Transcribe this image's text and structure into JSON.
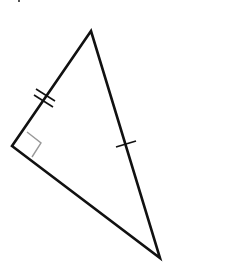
{
  "diagram": {
    "type": "geometry-triangle",
    "colors": {
      "background": "#ffffff",
      "stroke": "#111111",
      "right_angle_marker": "#999999"
    },
    "vertices": {
      "top": [
        91,
        31
      ],
      "left": [
        12,
        146
      ],
      "bottom": [
        160,
        258
      ]
    },
    "right_angle_at": "left",
    "tick_marks": {
      "left_top_side": 2,
      "top_bottom_side": 1,
      "left_bottom_side": 0
    },
    "labels": []
  }
}
